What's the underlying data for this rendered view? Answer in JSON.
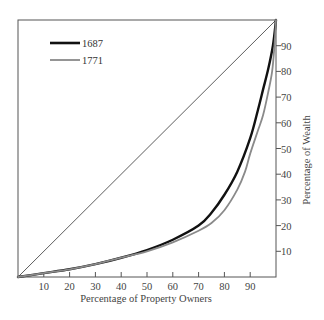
{
  "chart_data": {
    "type": "line",
    "title": "",
    "xlabel": "Percentage of Property Owners",
    "ylabel": "Percentage of Wealth",
    "xlim": [
      0,
      100
    ],
    "ylim": [
      0,
      100
    ],
    "x_ticks": [
      10,
      20,
      30,
      40,
      50,
      60,
      70,
      80,
      90
    ],
    "y_ticks": [
      10,
      20,
      30,
      40,
      50,
      60,
      70,
      80,
      90
    ],
    "grid": false,
    "legend_position": "upper left",
    "reference_line": {
      "name": "equality",
      "x": [
        0,
        100
      ],
      "y": [
        0,
        100
      ],
      "color": "#333333"
    },
    "series": [
      {
        "name": "1687",
        "color": "#111111",
        "width": 2.4,
        "x": [
          0,
          10,
          20,
          30,
          40,
          50,
          60,
          70,
          75,
          80,
          85,
          90,
          93,
          95,
          97,
          98.8,
          100
        ],
        "y": [
          0,
          1.5,
          3,
          5,
          7.5,
          10.5,
          14.5,
          20,
          25,
          32,
          41,
          54,
          65,
          73,
          81,
          90,
          100
        ]
      },
      {
        "name": "1771",
        "color": "#8a8a8a",
        "width": 1.8,
        "x": [
          0,
          10,
          20,
          30,
          40,
          50,
          60,
          70,
          75,
          80,
          85,
          88,
          90,
          93,
          95,
          97,
          98.5,
          99.4,
          100
        ],
        "y": [
          0,
          1.5,
          3,
          5,
          7.5,
          10,
          13.5,
          18,
          21,
          26,
          34,
          41,
          48,
          57,
          63,
          72,
          80,
          90,
          100
        ]
      }
    ]
  },
  "plot": {
    "left": 18,
    "top": 20,
    "right": 276,
    "bottom": 277
  }
}
